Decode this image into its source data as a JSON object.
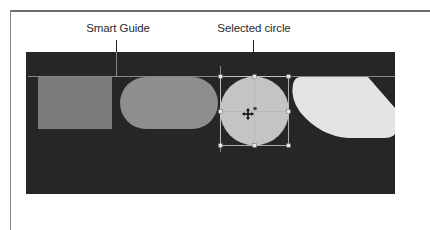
{
  "labels": {
    "smart_guide": "Smart Guide",
    "selected_circle": "Selected circle"
  },
  "colors": {
    "canvas": "#262626",
    "square": "#7c7c7c",
    "rounded_rect": "#8e8e8e",
    "circle": "#c4c4c4",
    "leaf": "#e4e4e4",
    "guide": "#9a9a9a",
    "handle": "#e8e8e8"
  },
  "shapes": [
    {
      "type": "square",
      "name": "Square"
    },
    {
      "type": "rounded-rectangle",
      "name": "Rounded rectangle"
    },
    {
      "type": "circle",
      "name": "Selected circle",
      "selected": true
    },
    {
      "type": "leaf",
      "name": "Leaf shape"
    }
  ],
  "cursor": "move-cursor"
}
